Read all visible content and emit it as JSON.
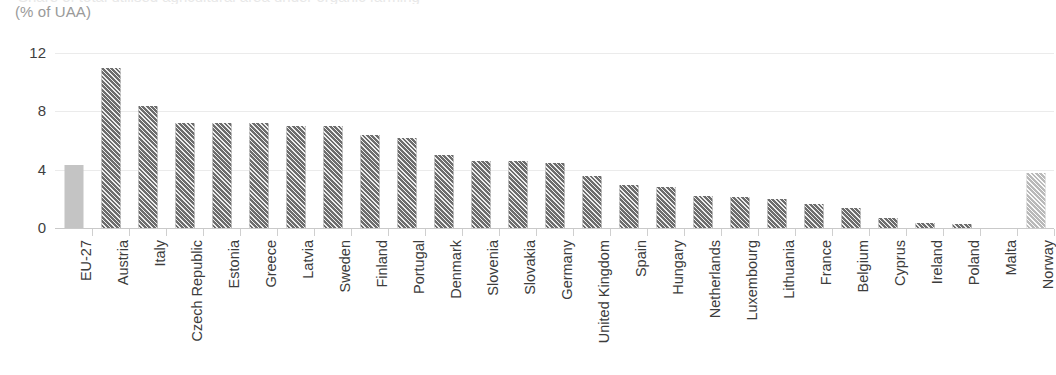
{
  "header": {
    "clipped_title": "Share of total utilised agricultural area under organic farming",
    "unit_label": "(% of UAA)"
  },
  "axis": {
    "y_ticks": [
      "0",
      "4",
      "8",
      "12"
    ]
  },
  "colors": {
    "aggregate_bar": "#c4c4c4",
    "country_bar": "#6d6d6d",
    "non_eu_bar": "#b9b9b9",
    "gridline": "#ebebeb",
    "baseline": "#c9c9c9",
    "label_text": "#3c3c3c",
    "unit_text": "#9a9a9a"
  },
  "chart_data": {
    "type": "bar",
    "title": "",
    "subtitle": "(% of UAA)",
    "xlabel": "",
    "ylabel": "",
    "ylim": [
      0,
      12
    ],
    "yticks": [
      0,
      4,
      8,
      12
    ],
    "grid": true,
    "legend": "none",
    "orientation": "vertical",
    "categories": [
      "EU-27",
      "Austria",
      "Italy",
      "Czech Republic",
      "Estonia",
      "Greece",
      "Latvia",
      "Sweden",
      "Finland",
      "Portugal",
      "Denmark",
      "Slovenia",
      "Slovakia",
      "Germany",
      "United Kingdom",
      "Spain",
      "Hungary",
      "Netherlands",
      "Luxembourg",
      "Lithuania",
      "France",
      "Belgium",
      "Cyprus",
      "Ireland",
      "Poland",
      "Malta",
      "Norway"
    ],
    "values": [
      4.3,
      11.0,
      8.4,
      7.2,
      7.2,
      7.2,
      7.0,
      7.0,
      6.4,
      6.2,
      5.0,
      4.6,
      4.6,
      4.45,
      3.55,
      2.95,
      2.8,
      2.2,
      2.1,
      2.0,
      1.65,
      1.35,
      0.7,
      0.35,
      0.3,
      0.05,
      3.8
    ],
    "bar_styles": [
      "solid",
      "hatch-dark",
      "hatch-dark",
      "hatch-dark",
      "hatch-dark",
      "hatch-dark",
      "hatch-dark",
      "hatch-dark",
      "hatch-dark",
      "hatch-dark",
      "hatch-dark",
      "hatch-dark",
      "hatch-dark",
      "hatch-dark",
      "hatch-dark",
      "hatch-dark",
      "hatch-dark",
      "hatch-dark",
      "hatch-dark",
      "hatch-dark",
      "hatch-dark",
      "hatch-dark",
      "hatch-dark",
      "hatch-dark",
      "hatch-dark",
      "hatch-dark",
      "hatch-light"
    ]
  }
}
